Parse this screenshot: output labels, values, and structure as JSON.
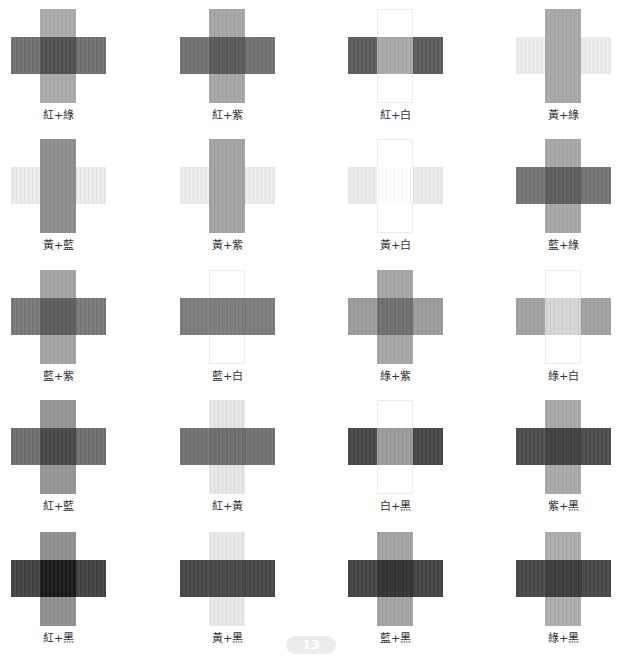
{
  "header": {
    "caption_partial": "(truncated heading text above crop)"
  },
  "swatches": [
    {
      "label": "紅+綠",
      "h": "#6e6e6e",
      "v": "#a9a9a9",
      "o": "#4d4d4d",
      "vwhite": false
    },
    {
      "label": "紅+紫",
      "h": "#6f6f6f",
      "v": "#a5a5a5",
      "o": "#575757",
      "vwhite": false
    },
    {
      "label": "紅+白",
      "h": "#5a5a5a",
      "v": "#ffffff",
      "o": "#a8a8a8",
      "vwhite": true
    },
    {
      "label": "黃+綠",
      "h": "#ececec",
      "v": "#a8a8a8",
      "o": "#a8a8a8",
      "vwhite": false
    },
    {
      "label": "黃+藍",
      "h": "#ececec",
      "v": "#8c8c8c",
      "o": "#8c8c8c",
      "vwhite": false
    },
    {
      "label": "黃+紫",
      "h": "#ececec",
      "v": "#a2a2a2",
      "o": "#a2a2a2",
      "vwhite": false
    },
    {
      "label": "黃+白",
      "h": "#eaeaea",
      "v": "#ffffff",
      "o": "#ffffff",
      "vwhite": true
    },
    {
      "label": "藍+綠",
      "h": "#717171",
      "v": "#a6a6a6",
      "o": "#5b5b5b",
      "vwhite": false
    },
    {
      "label": "藍+紫",
      "h": "#767676",
      "v": "#a3a3a3",
      "o": "#5a5a5a",
      "vwhite": false
    },
    {
      "label": "藍+白",
      "h": "#7a7a7a",
      "v": "#ffffff",
      "o": "#7a7a7a",
      "vwhite": true
    },
    {
      "label": "綠+紫",
      "h": "#9a9a9a",
      "v": "#a5a5a5",
      "o": "#6d6d6d",
      "vwhite": false
    },
    {
      "label": "綠+白",
      "h": "#a0a0a0",
      "v": "#ffffff",
      "o": "#d5d5d5",
      "vwhite": true
    },
    {
      "label": "紅+藍",
      "h": "#6b6b6b",
      "v": "#939393",
      "o": "#454545",
      "vwhite": false
    },
    {
      "label": "紅+黃",
      "h": "#6e6e6e",
      "v": "#e6e6e6",
      "o": "#6a6a6a",
      "vwhite": false
    },
    {
      "label": "白+黑",
      "h": "#454545",
      "v": "#ffffff",
      "o": "#9a9a9a",
      "vwhite": true
    },
    {
      "label": "紫+黑",
      "h": "#4a4a4a",
      "v": "#a8a8a8",
      "o": "#3d3d3d",
      "vwhite": false
    },
    {
      "label": "紅+黑",
      "h": "#3f3f3f",
      "v": "#8f8f8f",
      "o": "#151515",
      "vwhite": false
    },
    {
      "label": "黃+黑",
      "h": "#444444",
      "v": "#e8e8e8",
      "o": "#444444",
      "vwhite": false
    },
    {
      "label": "藍+黑",
      "h": "#404040",
      "v": "#a2a2a2",
      "o": "#2f2f2f",
      "vwhite": false
    },
    {
      "label": "綠+黑",
      "h": "#454545",
      "v": "#acacac",
      "o": "#383838",
      "vwhite": false
    }
  ],
  "footer": {
    "page_number": "13"
  }
}
